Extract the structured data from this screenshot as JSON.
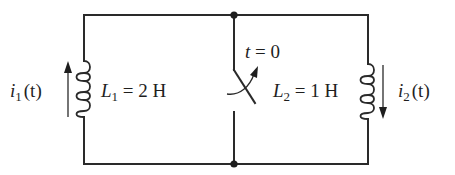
{
  "diagram": {
    "type": "circuit",
    "colors": {
      "ink": "#1e1e1e",
      "background": "#ffffff"
    },
    "components": [
      {
        "id": "L1",
        "kind": "inductor",
        "symbol": "L",
        "subscript": "1",
        "value": "2 H",
        "label": "L1 = 2 H",
        "position": "left branch"
      },
      {
        "id": "S",
        "kind": "switch",
        "label": "t = 0",
        "action": "opens at t = 0",
        "position": "middle branch"
      },
      {
        "id": "L2",
        "kind": "inductor",
        "symbol": "L",
        "subscript": "2",
        "value": "1 H",
        "label": "L2 = 1 H",
        "position": "right branch"
      }
    ],
    "currents": [
      {
        "id": "i1",
        "symbol": "i",
        "subscript": "1",
        "arg": "(t)",
        "label": "i1(t)",
        "direction": "up",
        "branch": "L1"
      },
      {
        "id": "i2",
        "symbol": "i",
        "subscript": "2",
        "arg": "(t)",
        "label": "i2(t)",
        "direction": "down",
        "branch": "L2"
      }
    ],
    "nodes": [
      {
        "id": "top",
        "label": "top junction"
      },
      {
        "id": "bottom",
        "label": "bottom junction"
      }
    ],
    "labels": {
      "L1_symbol": "L",
      "L1_sub": "1",
      "L1_value": " = 2 H",
      "L2_symbol": "L",
      "L2_sub": "2",
      "L2_value": " = 1 H",
      "switch_t": "t",
      "switch_value": " = 0",
      "i1_symbol": "i",
      "i1_sub": "1",
      "i1_arg": "(t)",
      "i2_symbol": "i",
      "i2_sub": "2",
      "i2_arg": "(t)"
    }
  }
}
